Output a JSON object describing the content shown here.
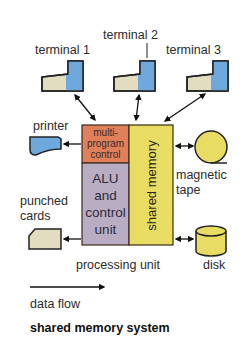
{
  "title": "shared memory system",
  "terminals": [
    {
      "label": "terminal 1"
    },
    {
      "label": "terminal 2"
    },
    {
      "label": "terminal 3"
    }
  ],
  "processing_unit": {
    "label": "processing unit",
    "multiprogram_control": [
      "multi-",
      "program",
      "control"
    ],
    "alu_control_unit": [
      "ALU",
      "and",
      "control",
      "unit"
    ],
    "shared_memory": "shared memory"
  },
  "peripherals": {
    "printer": "printer",
    "magnetic_tape": [
      "magnetic",
      "tape"
    ],
    "punched_cards": [
      "punched",
      "cards"
    ],
    "disk": "disk"
  },
  "legend": {
    "data_flow": "data flow"
  },
  "colors": {
    "terminal_screen": "#6fa8dc",
    "terminal_keyboard": "#e2ddc0",
    "multiprogram_control": "#e0805a",
    "alu_control": "#b9adc4",
    "shared_memory": "#e8dc62",
    "storage_yellow": "#e8dc62",
    "printer_blue": "#6fa8dc",
    "card_beige": "#e2ddc0"
  }
}
